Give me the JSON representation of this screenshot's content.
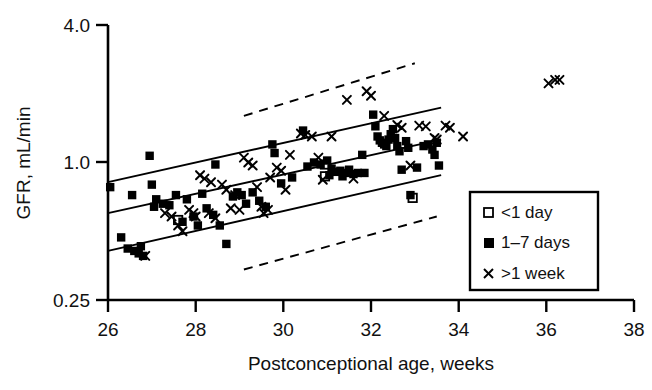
{
  "chart_data": {
    "type": "scatter",
    "title": "",
    "subtitle": "",
    "xlabel": "Postconceptional age, weeks",
    "ylabel": "GFR, mL/min",
    "xlim": [
      26,
      38
    ],
    "ylim": [
      0.25,
      4.0
    ],
    "yscale": "log",
    "xscale": "linear",
    "xticks": [
      26,
      28,
      30,
      32,
      34,
      36,
      38
    ],
    "xticklabels": [
      "26",
      "28",
      "30",
      "32",
      "34",
      "36",
      "38"
    ],
    "yticks": [
      0.25,
      1.0,
      4.0
    ],
    "yticklabels": [
      "0.25",
      "1.0",
      "4.0"
    ],
    "grid": false,
    "legend_position": "lower-right",
    "legend_entries": [
      {
        "marker": "open-square",
        "label": "<1 day"
      },
      {
        "marker": "filled-square",
        "label": "1–7 days"
      },
      {
        "marker": "cross",
        "label": ">1 week"
      }
    ],
    "series": [
      {
        "name": "<1 day",
        "marker": "open-square",
        "points": [
          [
            27.6,
            0.56
          ],
          [
            30.95,
            0.98
          ],
          [
            30.95,
            0.87
          ],
          [
            32.95,
            0.7
          ]
        ]
      },
      {
        "name": "1–7 days",
        "marker": "filled-square",
        "points": [
          [
            26.05,
            0.78
          ],
          [
            26.3,
            0.47
          ],
          [
            26.45,
            0.42
          ],
          [
            26.55,
            0.72
          ],
          [
            26.6,
            0.41
          ],
          [
            26.7,
            0.4
          ],
          [
            26.75,
            0.43
          ],
          [
            26.8,
            0.39
          ],
          [
            26.95,
            1.07
          ],
          [
            27.0,
            0.8
          ],
          [
            27.05,
            0.64
          ],
          [
            27.1,
            0.69
          ],
          [
            27.25,
            0.66
          ],
          [
            27.4,
            0.65
          ],
          [
            27.55,
            0.72
          ],
          [
            27.7,
            0.55
          ],
          [
            27.8,
            0.69
          ],
          [
            27.95,
            0.58
          ],
          [
            28.05,
            0.53
          ],
          [
            28.15,
            0.73
          ],
          [
            28.25,
            0.63
          ],
          [
            28.4,
            0.59
          ],
          [
            28.45,
            0.98
          ],
          [
            28.55,
            0.53
          ],
          [
            28.7,
            0.44
          ],
          [
            28.85,
            0.71
          ],
          [
            28.95,
            0.74
          ],
          [
            29.05,
            0.72
          ],
          [
            29.15,
            0.66
          ],
          [
            29.3,
            0.74
          ],
          [
            29.45,
            0.68
          ],
          [
            29.6,
            0.64
          ],
          [
            29.75,
            1.2
          ],
          [
            29.8,
            1.1
          ],
          [
            29.95,
            0.81
          ],
          [
            30.2,
            0.86
          ],
          [
            30.45,
            1.38
          ],
          [
            30.55,
            0.96
          ],
          [
            30.7,
            1.0
          ],
          [
            30.85,
            0.98
          ],
          [
            31.0,
            1.02
          ],
          [
            31.05,
            0.88
          ],
          [
            31.1,
            0.94
          ],
          [
            31.2,
            0.91
          ],
          [
            31.3,
            0.92
          ],
          [
            31.35,
            0.87
          ],
          [
            31.45,
            0.9
          ],
          [
            31.5,
            0.93
          ],
          [
            31.6,
            0.89
          ],
          [
            31.7,
            0.9
          ],
          [
            31.8,
            1.08
          ],
          [
            31.85,
            0.9
          ],
          [
            32.05,
            1.62
          ],
          [
            32.1,
            1.44
          ],
          [
            32.15,
            1.3
          ],
          [
            32.2,
            1.25
          ],
          [
            32.25,
            1.22
          ],
          [
            32.3,
            1.2
          ],
          [
            32.35,
            1.18
          ],
          [
            32.4,
            1.26
          ],
          [
            32.45,
            1.33
          ],
          [
            32.5,
            1.4
          ],
          [
            32.55,
            1.28
          ],
          [
            32.6,
            1.18
          ],
          [
            32.65,
            1.12
          ],
          [
            32.7,
            0.93
          ],
          [
            32.8,
            1.24
          ],
          [
            32.85,
            1.16
          ],
          [
            32.9,
            0.72
          ],
          [
            33.05,
            0.95
          ],
          [
            33.2,
            1.18
          ],
          [
            33.3,
            1.2
          ],
          [
            33.4,
            1.14
          ],
          [
            33.45,
            1.08
          ],
          [
            33.5,
            1.22
          ],
          [
            33.55,
            0.97
          ]
        ]
      },
      {
        "name": ">1 week",
        "marker": "cross",
        "points": [
          [
            26.85,
            0.39
          ],
          [
            27.3,
            0.6
          ],
          [
            27.45,
            0.58
          ],
          [
            27.6,
            0.53
          ],
          [
            27.7,
            0.5
          ],
          [
            27.85,
            0.62
          ],
          [
            27.95,
            0.6
          ],
          [
            28.0,
            0.58
          ],
          [
            28.1,
            0.88
          ],
          [
            28.2,
            0.85
          ],
          [
            28.3,
            0.6
          ],
          [
            28.35,
            0.82
          ],
          [
            28.45,
            0.57
          ],
          [
            28.6,
            0.8
          ],
          [
            28.7,
            0.76
          ],
          [
            28.8,
            0.63
          ],
          [
            28.9,
            0.72
          ],
          [
            29.0,
            0.62
          ],
          [
            29.1,
            1.05
          ],
          [
            29.2,
            1.0
          ],
          [
            29.3,
            0.97
          ],
          [
            29.4,
            0.78
          ],
          [
            29.5,
            0.64
          ],
          [
            29.55,
            0.6
          ],
          [
            29.65,
            0.62
          ],
          [
            29.7,
            0.86
          ],
          [
            29.85,
            0.95
          ],
          [
            29.95,
            0.92
          ],
          [
            30.05,
            0.76
          ],
          [
            30.15,
            1.08
          ],
          [
            30.4,
            1.34
          ],
          [
            30.5,
            1.32
          ],
          [
            30.65,
            1.3
          ],
          [
            30.8,
            1.05
          ],
          [
            30.9,
            0.84
          ],
          [
            31.1,
            1.3
          ],
          [
            31.45,
            1.88
          ],
          [
            31.6,
            0.85
          ],
          [
            31.9,
            2.05
          ],
          [
            32.0,
            1.96
          ],
          [
            32.3,
            1.6
          ],
          [
            32.6,
            1.46
          ],
          [
            32.7,
            1.42
          ],
          [
            32.9,
            0.97
          ],
          [
            33.1,
            1.45
          ],
          [
            33.25,
            1.44
          ],
          [
            33.45,
            1.28
          ],
          [
            33.5,
            1.26
          ],
          [
            33.7,
            1.45
          ],
          [
            33.8,
            1.42
          ],
          [
            34.1,
            1.3
          ],
          [
            36.05,
            2.22
          ],
          [
            36.2,
            2.3
          ],
          [
            36.3,
            2.3
          ]
        ]
      }
    ],
    "fit_lines": [
      {
        "name": "regression-line",
        "style": "solid",
        "x": [
          26.0,
          33.6
        ],
        "y": [
          0.6,
          1.26
        ]
      },
      {
        "name": "upper-prediction-solid",
        "style": "solid",
        "x": [
          26.0,
          33.6
        ],
        "y": [
          0.82,
          1.74
        ]
      },
      {
        "name": "lower-prediction-solid",
        "style": "solid",
        "x": [
          26.0,
          33.6
        ],
        "y": [
          0.41,
          0.88
        ]
      },
      {
        "name": "upper-confidence-dashed",
        "style": "dashed",
        "x": [
          29.1,
          33.0
        ],
        "y": [
          1.6,
          2.72
        ]
      },
      {
        "name": "lower-confidence-dashed",
        "style": "dashed",
        "x": [
          29.1,
          33.5
        ],
        "y": [
          0.34,
          0.58
        ]
      }
    ]
  },
  "axes": {
    "y_tick_labels": [
      "4.0",
      "1.0",
      "0.25"
    ],
    "x_tick_labels": [
      "26",
      "28",
      "30",
      "32",
      "34",
      "36",
      "38"
    ],
    "y_axis_title": "GFR, mL/min",
    "x_axis_title": "Postconceptional age, weeks"
  },
  "legend": {
    "items": [
      {
        "label": "<1 day",
        "marker": "open-square"
      },
      {
        "label": "1–7 days",
        "marker": "filled-square"
      },
      {
        "label": ">1 week",
        "marker": "cross"
      }
    ]
  },
  "colors": {
    "ink": "#000000",
    "background": "#ffffff",
    "marker": "#000000"
  }
}
